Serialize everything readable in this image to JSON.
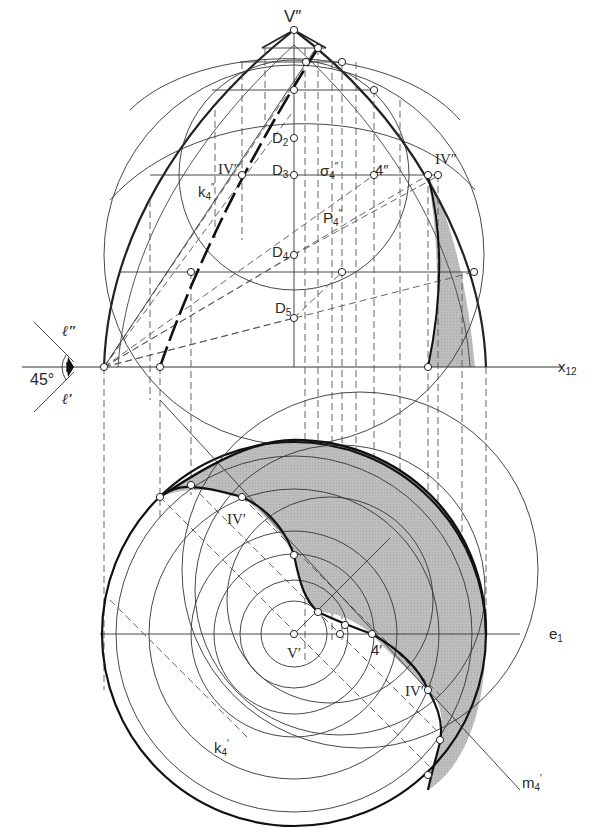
{
  "figure": {
    "type": "descriptive-geometry-shadow-construction",
    "views": [
      "front-elevation",
      "plan"
    ],
    "colors": {
      "line": "#222222",
      "shadow_fill": "#b9b9b9",
      "background": "#ffffff",
      "dash": "#555555"
    }
  },
  "labels": {
    "apex_front": "V″",
    "apex_plan": "V′",
    "d2": "D",
    "d2_sub": "2",
    "d3": "D",
    "d3_sub": "3",
    "d4": "D",
    "d4_sub": "4",
    "d5": "D",
    "d5_sub": "5",
    "iv_front_left": "IV″",
    "iv_front_right": "IV″",
    "iv_plan_top": "IV′",
    "iv_plan_right": "IV′",
    "point4_front": "4″",
    "point4_plan": "4′",
    "sigma": "σ",
    "sigma_sub": "4",
    "sigma_sup": "″",
    "p": "P",
    "p_sub": "4",
    "p_sup": "″",
    "k_front": "k",
    "k_front_sub": "4",
    "k_front_sup": "″",
    "k_plan": "k",
    "k_plan_sub": "4",
    "k_plan_sup": "′",
    "m_plan": "m",
    "m_plan_sub": "4",
    "m_plan_sup": "′",
    "axis_x": "x",
    "axis_x_sub": "12",
    "axis_e": "e",
    "axis_e_sub": "1",
    "light_front": "ℓ″",
    "light_plan": "ℓ′",
    "angle": "45°"
  }
}
